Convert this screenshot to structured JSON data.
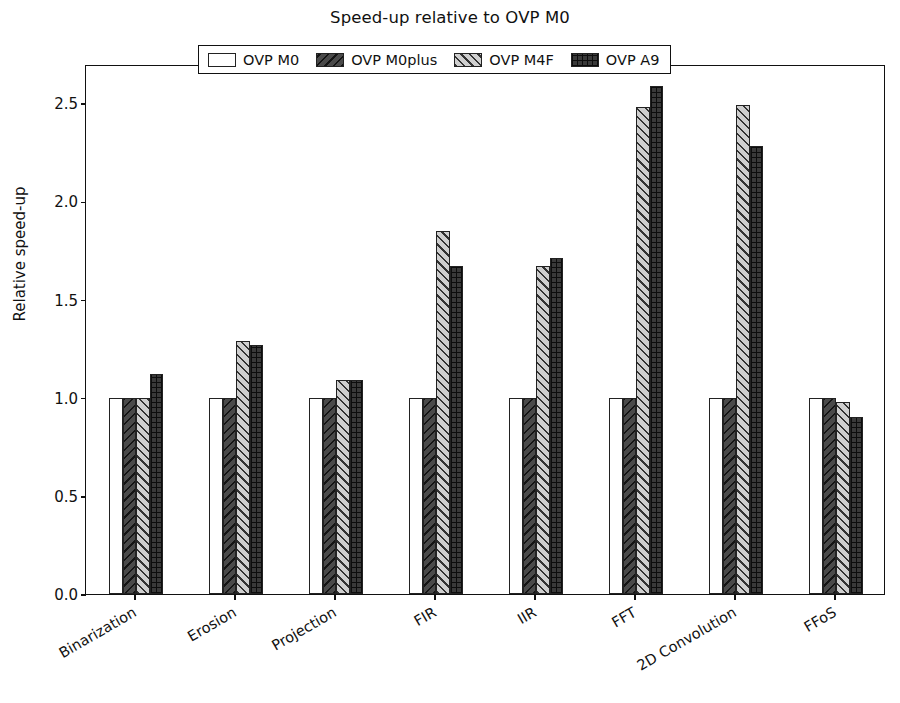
{
  "chart_data": {
    "type": "bar",
    "title": "Speed-up relative to OVP M0",
    "xlabel": "",
    "ylabel": "Relative speed-up",
    "ylim": [
      0.0,
      2.7
    ],
    "yticks": [
      "0.0",
      "0.5",
      "1.0",
      "1.5",
      "2.0",
      "2.5"
    ],
    "ytick_values": [
      0.0,
      0.5,
      1.0,
      1.5,
      2.0,
      2.5
    ],
    "grid": false,
    "legend_position": "upper center",
    "categories": [
      "Binarization",
      "Erosion",
      "Projection",
      "FIR",
      "IIR",
      "FFT",
      "2D Convolution",
      "FFoS"
    ],
    "series": [
      {
        "name": "OVP M0",
        "hatch": "vertical",
        "color": "#8c8c8c",
        "values": [
          1.0,
          1.0,
          1.0,
          1.0,
          1.0,
          1.0,
          1.0,
          1.0
        ]
      },
      {
        "name": "OVP M0plus",
        "hatch": "backslash",
        "color": "#4a4a4a",
        "values": [
          1.0,
          1.0,
          1.0,
          1.0,
          1.0,
          1.0,
          1.0,
          1.0
        ]
      },
      {
        "name": "OVP M4F",
        "hatch": "slash",
        "color": "#cfcfcf",
        "values": [
          1.0,
          1.29,
          1.09,
          1.85,
          1.67,
          2.48,
          2.49,
          0.98
        ]
      },
      {
        "name": "OVP A9",
        "hatch": "cross",
        "color": "#3a3a3a",
        "values": [
          1.12,
          1.27,
          1.09,
          1.67,
          1.71,
          2.59,
          2.28,
          0.9
        ]
      }
    ]
  },
  "legend": {
    "entries": [
      {
        "label": "OVP M0"
      },
      {
        "label": "OVP M0plus"
      },
      {
        "label": "OVP M4F"
      },
      {
        "label": "OVP A9"
      }
    ]
  }
}
